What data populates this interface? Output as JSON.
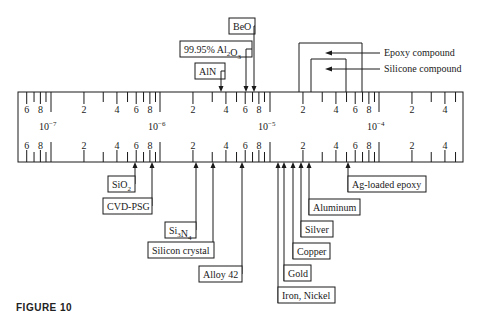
{
  "figure": {
    "caption": "FIGURE 10"
  },
  "scale": {
    "decades": [
      {
        "exponent": "-7",
        "label_base": "10",
        "x": 51
      },
      {
        "exponent": "-6",
        "label_base": "10",
        "x": 160
      },
      {
        "exponent": "-5",
        "label_base": "10",
        "x": 270
      },
      {
        "exponent": "-4",
        "label_base": "10",
        "x": 379
      }
    ],
    "minor_labels": [
      "2",
      "4",
      "6",
      "8"
    ],
    "decade_width": 109.5,
    "range": {
      "x_start": 18,
      "x_end": 463,
      "y_top": 92,
      "y_bottom": 162
    }
  },
  "top_materials": [
    {
      "name": "AlN",
      "x": 221,
      "box": {
        "x": 195,
        "y": 63,
        "w": 30,
        "h": 16
      }
    },
    {
      "name": "99.95% Al2O3",
      "name_html": "99.95% Al<sub>2</sub>O<sub>3</sub>",
      "x": 246,
      "box": {
        "x": 180,
        "y": 41,
        "w": 72,
        "h": 16
      }
    },
    {
      "name": "BeO",
      "x": 254,
      "box": {
        "x": 229,
        "y": 18,
        "w": 26,
        "h": 16
      }
    }
  ],
  "bracket_materials": [
    {
      "name": "Epoxy compound",
      "x_left": 299,
      "x_right": 362,
      "y_top": 43,
      "arrow_x": 325,
      "label_x": 384,
      "label_y": 56
    },
    {
      "name": "Silicone compound",
      "x_left": 311,
      "x_right": 346,
      "y_top": 59,
      "arrow_x": 325,
      "label_x": 384,
      "label_y": 72
    }
  ],
  "bottom_materials": [
    {
      "name": "SiO2",
      "x": 135,
      "box": {
        "x": 108,
        "y": 176,
        "w": 27,
        "h": 16
      }
    },
    {
      "name": "CVD-PSG",
      "x": 152,
      "box": {
        "x": 103,
        "y": 198,
        "w": 49,
        "h": 16
      }
    },
    {
      "name": "Si3N4",
      "x": 196,
      "box": {
        "x": 165,
        "y": 222,
        "w": 31,
        "h": 16
      }
    },
    {
      "name": "Silicon crystal",
      "x": 213,
      "box": {
        "x": 148,
        "y": 242,
        "w": 66,
        "h": 16
      }
    },
    {
      "name": "Alloy 42",
      "x": 242,
      "box": {
        "x": 199,
        "y": 266,
        "w": 43,
        "h": 16
      }
    },
    {
      "name": "Iron, Nickel",
      "x": 278,
      "box": {
        "x": 278,
        "y": 287,
        "w": 57,
        "h": 16
      }
    },
    {
      "name": "Gold",
      "x": 284,
      "box": {
        "x": 284,
        "y": 265,
        "w": 27,
        "h": 16
      }
    },
    {
      "name": "Copper",
      "x": 293,
      "box": {
        "x": 293,
        "y": 243,
        "w": 37,
        "h": 16
      }
    },
    {
      "name": "Silver",
      "x": 301,
      "box": {
        "x": 301,
        "y": 221,
        "w": 32,
        "h": 16
      }
    },
    {
      "name": "Aluminum",
      "x": 309,
      "box": {
        "x": 309,
        "y": 199,
        "w": 51,
        "h": 16
      }
    },
    {
      "name": "Ag-loaded epoxy",
      "x": 348,
      "box": {
        "x": 348,
        "y": 176,
        "w": 78,
        "h": 16
      }
    }
  ]
}
